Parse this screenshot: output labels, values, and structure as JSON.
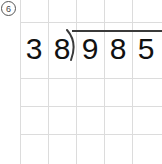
{
  "worksheet": {
    "problem_number": "6",
    "problem_number_style": "circled",
    "type": "long-division",
    "divisor": "38",
    "dividend": "985",
    "expression": "985 ÷ 38",
    "quotient_area": "",
    "divisor_digits": [
      "3",
      "8"
    ],
    "dividend_digits": [
      "9",
      "8",
      "5"
    ],
    "grid": {
      "background_color": "#ffffff",
      "line_color": "#dcdcdc",
      "vertical_lines_x": [
        20,
        48,
        76,
        104,
        132
      ],
      "horizontal_lines_y": [
        22,
        78,
        106,
        134
      ]
    },
    "bracket": {
      "color": "#3a3a3a",
      "vinculum_y": 30,
      "vinculum_x_start": 72,
      "vinculum_x_end": 162
    },
    "digit_color": "#111111"
  }
}
